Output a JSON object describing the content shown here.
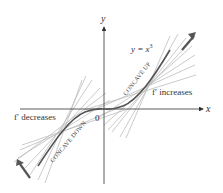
{
  "diagram": {
    "function_label": "y = x",
    "function_exponent": "3",
    "axis_x_label": "x",
    "axis_y_label": "y",
    "origin_label": "0",
    "right_label": "f′ increases",
    "left_label": "f′ decreases",
    "upper_region_label": "CONCAVE UP",
    "lower_region_label": "CONCAVE DOWN"
  },
  "colors": {
    "axis": "#333333",
    "curve": "#555555",
    "tangent": "#bbbbbb",
    "arrow": "#555555",
    "text": "#333333"
  }
}
